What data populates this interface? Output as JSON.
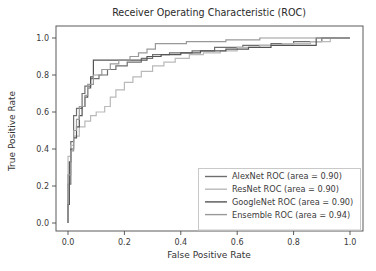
{
  "figure": {
    "width_px": 376,
    "height_px": 271,
    "background": "#ffffff",
    "spine_color": "#5a5a5a",
    "tick_color": "#4a4a4a"
  },
  "chart_data": {
    "type": "line",
    "subtype": "roc-step-curves",
    "title": "Receiver Operating Characteristic (ROC)",
    "xlabel": "False Positive Rate",
    "ylabel": "True Positive Rate",
    "xlim": [
      -0.04,
      1.05
    ],
    "ylim": [
      -0.045,
      1.06
    ],
    "x_ticks": [
      0.0,
      0.2,
      0.4,
      0.6,
      0.8,
      1.0
    ],
    "y_ticks": [
      0.0,
      0.2,
      0.4,
      0.6,
      0.8,
      1.0
    ],
    "x_tick_labels": [
      "0.0",
      "0.2",
      "0.4",
      "0.6",
      "0.8",
      "1.0"
    ],
    "y_tick_labels": [
      "0.0",
      "0.2",
      "0.4",
      "0.6",
      "0.8",
      "1.0"
    ],
    "grid": false,
    "legend": {
      "position": "lower right",
      "border_color": "#c9c9c9",
      "background": "#ffffff",
      "entries": [
        "AlexNet ROC (area = 0.90)",
        "ResNet ROC (area = 0.90)",
        "GoogleNet ROC (area = 0.90)",
        "Ensemble ROC (area = 0.94)"
      ]
    },
    "series": [
      {
        "name": "AlexNet ROC (area = 0.90)",
        "model": "AlexNet",
        "auc": 0.9,
        "color": "#6f6f6f",
        "points": [
          [
            0,
            0
          ],
          [
            0,
            0.21
          ],
          [
            0.01,
            0.21
          ],
          [
            0.01,
            0.44
          ],
          [
            0.02,
            0.44
          ],
          [
            0.02,
            0.58
          ],
          [
            0.03,
            0.58
          ],
          [
            0.03,
            0.62
          ],
          [
            0.05,
            0.62
          ],
          [
            0.05,
            0.7
          ],
          [
            0.06,
            0.7
          ],
          [
            0.06,
            0.74
          ],
          [
            0.08,
            0.74
          ],
          [
            0.08,
            0.78
          ],
          [
            0.11,
            0.78
          ],
          [
            0.11,
            0.8
          ],
          [
            0.14,
            0.8
          ],
          [
            0.14,
            0.83
          ],
          [
            0.17,
            0.83
          ],
          [
            0.17,
            0.85
          ],
          [
            0.21,
            0.85
          ],
          [
            0.21,
            0.87
          ],
          [
            0.26,
            0.87
          ],
          [
            0.26,
            0.89
          ],
          [
            0.3,
            0.89
          ],
          [
            0.3,
            0.91
          ],
          [
            0.36,
            0.91
          ],
          [
            0.36,
            0.92
          ],
          [
            0.44,
            0.92
          ],
          [
            0.44,
            0.93
          ],
          [
            0.52,
            0.93
          ],
          [
            0.52,
            0.95
          ],
          [
            0.62,
            0.95
          ],
          [
            0.62,
            0.96
          ],
          [
            0.72,
            0.96
          ],
          [
            0.72,
            0.97
          ],
          [
            0.8,
            0.97
          ],
          [
            0.8,
            0.98
          ],
          [
            0.9,
            0.98
          ],
          [
            0.9,
            1.0
          ],
          [
            1,
            1
          ]
        ]
      },
      {
        "name": "ResNet ROC (area = 0.90)",
        "model": "ResNet",
        "auc": 0.9,
        "color": "#b9b9b9",
        "points": [
          [
            0,
            0
          ],
          [
            0,
            0.36
          ],
          [
            0.01,
            0.36
          ],
          [
            0.01,
            0.42
          ],
          [
            0.02,
            0.42
          ],
          [
            0.02,
            0.47
          ],
          [
            0.04,
            0.47
          ],
          [
            0.04,
            0.52
          ],
          [
            0.06,
            0.52
          ],
          [
            0.06,
            0.55
          ],
          [
            0.08,
            0.55
          ],
          [
            0.08,
            0.58
          ],
          [
            0.1,
            0.58
          ],
          [
            0.1,
            0.6
          ],
          [
            0.13,
            0.6
          ],
          [
            0.13,
            0.63
          ],
          [
            0.15,
            0.63
          ],
          [
            0.15,
            0.68
          ],
          [
            0.17,
            0.68
          ],
          [
            0.17,
            0.72
          ],
          [
            0.2,
            0.72
          ],
          [
            0.2,
            0.76
          ],
          [
            0.23,
            0.76
          ],
          [
            0.23,
            0.79
          ],
          [
            0.26,
            0.79
          ],
          [
            0.26,
            0.82
          ],
          [
            0.3,
            0.82
          ],
          [
            0.3,
            0.85
          ],
          [
            0.34,
            0.85
          ],
          [
            0.34,
            0.87
          ],
          [
            0.38,
            0.87
          ],
          [
            0.38,
            0.89
          ],
          [
            0.43,
            0.89
          ],
          [
            0.43,
            0.91
          ],
          [
            0.48,
            0.91
          ],
          [
            0.48,
            0.92
          ],
          [
            0.54,
            0.92
          ],
          [
            0.54,
            0.93
          ],
          [
            0.6,
            0.93
          ],
          [
            0.6,
            0.95
          ],
          [
            0.68,
            0.95
          ],
          [
            0.68,
            0.96
          ],
          [
            0.76,
            0.96
          ],
          [
            0.76,
            0.97
          ],
          [
            0.86,
            0.97
          ],
          [
            0.86,
            0.98
          ],
          [
            0.93,
            0.98
          ],
          [
            0.93,
            1.0
          ],
          [
            1,
            1
          ]
        ]
      },
      {
        "name": "GoogleNet ROC (area = 0.90)",
        "model": "GoogleNet",
        "auc": 0.9,
        "color": "#555555",
        "points": [
          [
            0,
            0
          ],
          [
            0,
            0.1
          ],
          [
            0.005,
            0.1
          ],
          [
            0.005,
            0.33
          ],
          [
            0.01,
            0.33
          ],
          [
            0.01,
            0.4
          ],
          [
            0.02,
            0.4
          ],
          [
            0.02,
            0.46
          ],
          [
            0.03,
            0.46
          ],
          [
            0.03,
            0.52
          ],
          [
            0.04,
            0.52
          ],
          [
            0.04,
            0.58
          ],
          [
            0.05,
            0.58
          ],
          [
            0.05,
            0.63
          ],
          [
            0.06,
            0.63
          ],
          [
            0.06,
            0.68
          ],
          [
            0.07,
            0.68
          ],
          [
            0.07,
            0.73
          ],
          [
            0.08,
            0.73
          ],
          [
            0.08,
            0.79
          ],
          [
            0.09,
            0.79
          ],
          [
            0.09,
            0.88
          ],
          [
            0.28,
            0.88
          ],
          [
            0.28,
            0.9
          ],
          [
            0.33,
            0.9
          ],
          [
            0.33,
            0.91
          ],
          [
            0.4,
            0.91
          ],
          [
            0.4,
            0.92
          ],
          [
            0.47,
            0.92
          ],
          [
            0.47,
            0.93
          ],
          [
            0.56,
            0.93
          ],
          [
            0.56,
            0.94
          ],
          [
            0.64,
            0.94
          ],
          [
            0.64,
            0.95
          ],
          [
            0.72,
            0.95
          ],
          [
            0.72,
            0.96
          ],
          [
            0.88,
            0.96
          ],
          [
            0.88,
            1.0
          ],
          [
            1,
            1
          ]
        ]
      },
      {
        "name": "Ensemble ROC (area = 0.94)",
        "model": "Ensemble",
        "auc": 0.94,
        "color": "#999999",
        "points": [
          [
            0,
            0
          ],
          [
            0,
            0.26
          ],
          [
            0.01,
            0.26
          ],
          [
            0.01,
            0.39
          ],
          [
            0.02,
            0.39
          ],
          [
            0.02,
            0.5
          ],
          [
            0.03,
            0.5
          ],
          [
            0.03,
            0.56
          ],
          [
            0.04,
            0.56
          ],
          [
            0.04,
            0.63
          ],
          [
            0.06,
            0.63
          ],
          [
            0.06,
            0.69
          ],
          [
            0.07,
            0.69
          ],
          [
            0.07,
            0.75
          ],
          [
            0.09,
            0.75
          ],
          [
            0.09,
            0.8
          ],
          [
            0.12,
            0.8
          ],
          [
            0.12,
            0.83
          ],
          [
            0.15,
            0.83
          ],
          [
            0.15,
            0.86
          ],
          [
            0.18,
            0.86
          ],
          [
            0.18,
            0.88
          ],
          [
            0.22,
            0.88
          ],
          [
            0.22,
            0.9
          ],
          [
            0.25,
            0.9
          ],
          [
            0.25,
            0.92
          ],
          [
            0.28,
            0.92
          ],
          [
            0.28,
            0.94
          ],
          [
            0.31,
            0.94
          ],
          [
            0.31,
            0.97
          ],
          [
            0.42,
            0.97
          ],
          [
            0.42,
            0.98
          ],
          [
            0.56,
            0.98
          ],
          [
            0.56,
            0.99
          ],
          [
            0.68,
            0.99
          ],
          [
            0.68,
            1.0
          ],
          [
            1,
            1
          ]
        ]
      }
    ]
  }
}
